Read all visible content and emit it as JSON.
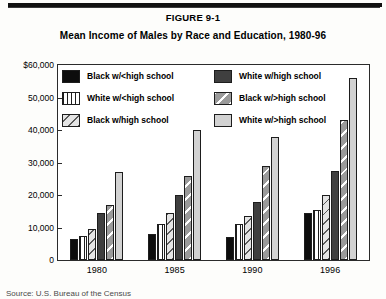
{
  "figure": {
    "number": "FIGURE 9-1",
    "title": "Mean Income of Males by Race and Education, 1980-96",
    "source": "Source: U.S. Bureau of the Census"
  },
  "legend": {
    "left": [
      {
        "label": "Black w/<high school",
        "swatch": "solid-black"
      },
      {
        "label": "White w/<high school",
        "swatch": "vertical-stripes"
      },
      {
        "label": "Black w/high school",
        "swatch": "diagonal-light"
      }
    ],
    "right": [
      {
        "label": "White w/high school",
        "swatch": "solid-dark-gray"
      },
      {
        "label": "Black w/>high school",
        "swatch": "diagonal-mid-gray"
      },
      {
        "label": "White w/>high school",
        "swatch": "solid-light-gray"
      }
    ]
  },
  "axis": {
    "y_ticks": [
      "$60,000",
      "50,000",
      "40,000",
      "30,000",
      "20,000",
      "10,000",
      "0"
    ],
    "x_ticks": [
      "1980",
      "1985",
      "1990",
      "1996"
    ]
  },
  "chart_data": {
    "type": "bar",
    "title": "Mean Income of Males by Race and Education, 1980-96",
    "xlabel": "",
    "ylabel": "",
    "ylim": [
      0,
      60000
    ],
    "ytick_values": [
      0,
      10000,
      20000,
      30000,
      40000,
      50000,
      60000
    ],
    "grid": false,
    "legend_position": "inside-top-left",
    "categories": [
      "1980",
      "1985",
      "1990",
      "1996"
    ],
    "series": [
      {
        "name": "Black w/<high school",
        "fill": "solid-black",
        "values": [
          6500,
          8000,
          7000,
          14500
        ]
      },
      {
        "name": "White w/<high school",
        "fill": "vertical-stripes",
        "values": [
          7500,
          11000,
          11000,
          15500
        ]
      },
      {
        "name": "Black w/high school",
        "fill": "diagonal-light",
        "values": [
          9500,
          14500,
          13500,
          20000
        ]
      },
      {
        "name": "White w/high school",
        "fill": "solid-dark-gray",
        "values": [
          14500,
          20000,
          18000,
          27500
        ]
      },
      {
        "name": "Black w/>high school",
        "fill": "diagonal-mid-gray",
        "values": [
          17000,
          26000,
          29000,
          43000
        ]
      },
      {
        "name": "White w/>high school",
        "fill": "solid-light-gray",
        "values": [
          27000,
          40000,
          38000,
          56000
        ]
      }
    ]
  }
}
